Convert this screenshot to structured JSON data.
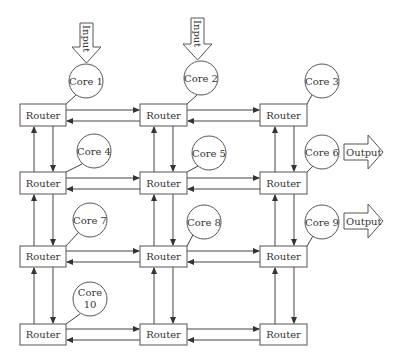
{
  "diagram": {
    "type": "network-on-chip mesh",
    "router_label": "Router",
    "grid": {
      "rows": 4,
      "cols": 3
    },
    "routers": [
      {
        "id": "r11",
        "row": 1,
        "col": 1,
        "label": "Router"
      },
      {
        "id": "r12",
        "row": 1,
        "col": 2,
        "label": "Router"
      },
      {
        "id": "r13",
        "row": 1,
        "col": 3,
        "label": "Router"
      },
      {
        "id": "r21",
        "row": 2,
        "col": 1,
        "label": "Router"
      },
      {
        "id": "r22",
        "row": 2,
        "col": 2,
        "label": "Router"
      },
      {
        "id": "r23",
        "row": 2,
        "col": 3,
        "label": "Router"
      },
      {
        "id": "r31",
        "row": 3,
        "col": 1,
        "label": "Router"
      },
      {
        "id": "r32",
        "row": 3,
        "col": 2,
        "label": "Router"
      },
      {
        "id": "r33",
        "row": 3,
        "col": 3,
        "label": "Router"
      },
      {
        "id": "r41",
        "row": 4,
        "col": 1,
        "label": "Router"
      },
      {
        "id": "r42",
        "row": 4,
        "col": 2,
        "label": "Router"
      },
      {
        "id": "r43",
        "row": 4,
        "col": 3,
        "label": "Router"
      }
    ],
    "cores": [
      {
        "id": "core1",
        "label": "Core 1",
        "router": "r11"
      },
      {
        "id": "core2",
        "label": "Core 2",
        "router": "r12"
      },
      {
        "id": "core3",
        "label": "Core 3",
        "router": "r13"
      },
      {
        "id": "core4",
        "label": "Core 4",
        "router": "r21"
      },
      {
        "id": "core5",
        "label": "Core 5",
        "router": "r22"
      },
      {
        "id": "core6",
        "label": "Core 6",
        "router": "r23"
      },
      {
        "id": "core7",
        "label": "Core 7",
        "router": "r31"
      },
      {
        "id": "core8",
        "label": "Core 8",
        "router": "r32"
      },
      {
        "id": "core9",
        "label": "Core 9",
        "router": "r33"
      },
      {
        "id": "core10",
        "label_line1": "Core",
        "label_line2": "10",
        "router": "r41"
      }
    ],
    "inputs": [
      {
        "label": "Input",
        "target": "Core 1"
      },
      {
        "label": "Input",
        "target": "Core 2"
      }
    ],
    "outputs": [
      {
        "label": "Output",
        "source": "Core 6"
      },
      {
        "label": "Output",
        "source": "Core 9"
      }
    ],
    "colors": {
      "stroke": "#555555",
      "text": "#333333",
      "background": "#ffffff"
    }
  }
}
